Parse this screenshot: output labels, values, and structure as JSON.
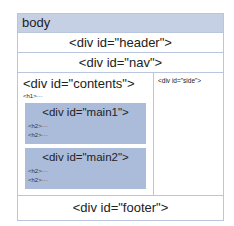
{
  "diagram": {
    "body_label": "body",
    "header_label": "<div id=\"header\">",
    "nav_label": "<div id=\"nav\">",
    "contents": {
      "label": "<div id=\"contents\">",
      "h1_label": "<h1>···",
      "main1": {
        "label": "<div id=\"main1\">",
        "items": [
          "<h2>···",
          "<h2>···"
        ]
      },
      "main2": {
        "label": "<div id=\"main2\">",
        "items": [
          "<h2>···",
          "<h2>···"
        ]
      }
    },
    "side_label": "<div id=\"side\">",
    "footer_label": "<div id=\"footer\">",
    "colors": {
      "border": "#b9c6de",
      "body_band": "#c6d0e4",
      "main_fill": "#aabcda"
    }
  }
}
